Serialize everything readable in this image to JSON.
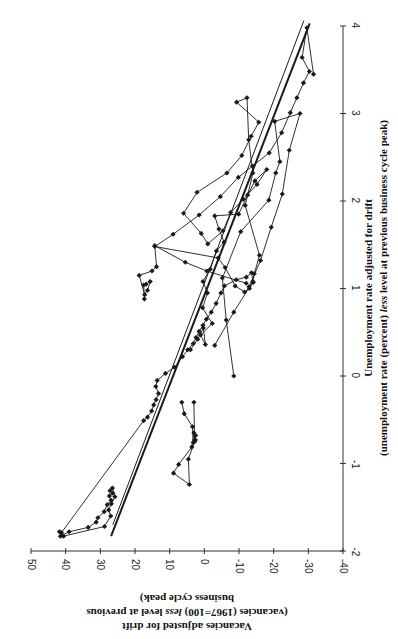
{
  "chart_data": {
    "type": "line",
    "orientation": "rotated 90deg clockwise (x-axis drawn vertically on right, y-axis drawn horizontally at bottom)",
    "title": "",
    "xlabel": "Unemployment rate adjusted for drift",
    "xlabel_sub": "(unemployment rate (percent) less level at previous business cycle peak)",
    "ylabel": "Vacancies adjusted for drift",
    "ylabel_sub_1": "(vacancies (1967=100) less level at previous",
    "ylabel_sub_2": "business cycle peak)",
    "xlim": [
      -2,
      4
    ],
    "ylim": [
      -40,
      50
    ],
    "x_ticks": [
      -2,
      -1,
      0,
      1,
      2,
      3,
      4
    ],
    "y_ticks": [
      50,
      40,
      30,
      20,
      10,
      0,
      -10,
      -20,
      -30,
      -40
    ],
    "grid": false,
    "legend": null,
    "marker": "diamond",
    "line_color": "#1a1a1a",
    "series": [
      {
        "name": "Vacancies vs unemployment (path)",
        "points": [
          [
            -1.83,
            41.5
          ],
          [
            -1.78,
            39.0
          ],
          [
            -1.73,
            33.5
          ],
          [
            -1.67,
            31.2
          ],
          [
            -1.62,
            30.7
          ],
          [
            -1.55,
            28.9
          ],
          [
            -1.47,
            28.0
          ],
          [
            -1.42,
            26.9
          ],
          [
            -1.37,
            27.4
          ],
          [
            -1.34,
            26.4
          ],
          [
            -1.31,
            27.2
          ],
          [
            -1.28,
            26.5
          ],
          [
            -1.38,
            25.8
          ],
          [
            -1.46,
            26.8
          ],
          [
            -1.53,
            27.6
          ],
          [
            -1.6,
            27.0
          ],
          [
            -1.72,
            28.8
          ],
          [
            -1.83,
            40.6
          ],
          [
            -1.78,
            41.8
          ],
          [
            -1.79,
            41.2
          ],
          [
            -0.51,
            17.5
          ],
          [
            -0.47,
            16.4
          ],
          [
            -0.4,
            15.2
          ],
          [
            -0.33,
            14.6
          ],
          [
            -0.27,
            13.9
          ],
          [
            -0.2,
            13.2
          ],
          [
            -0.12,
            14.0
          ],
          [
            -0.05,
            13.6
          ],
          [
            0.03,
            11.2
          ],
          [
            0.1,
            8.6
          ],
          [
            0.22,
            6.3
          ],
          [
            0.3,
            4.8
          ],
          [
            0.37,
            3.2
          ],
          [
            0.44,
            2.4
          ],
          [
            0.51,
            1.5
          ],
          [
            0.58,
            0.4
          ],
          [
            0.65,
            -0.6
          ],
          [
            0.73,
            -2.0
          ],
          [
            0.83,
            -3.4
          ],
          [
            0.95,
            -4.8
          ],
          [
            1.03,
            -5.8
          ],
          [
            1.1,
            -9.2
          ],
          [
            1.13,
            -12.1
          ],
          [
            1.18,
            -13.6
          ],
          [
            1.07,
            -14.1
          ],
          [
            1.0,
            -13.0
          ],
          [
            0.96,
            -11.6
          ],
          [
            1.03,
            -8.9
          ],
          [
            1.24,
            -6.0
          ],
          [
            1.35,
            -4.0
          ],
          [
            1.48,
            14.3
          ],
          [
            1.62,
            9.0
          ],
          [
            1.84,
            1.5
          ],
          [
            2.05,
            -4.6
          ],
          [
            2.27,
            -9.8
          ],
          [
            2.4,
            -13.9
          ],
          [
            2.55,
            -18.7
          ],
          [
            2.78,
            -22.3
          ],
          [
            3.01,
            -24.8
          ],
          [
            3.18,
            -26.7
          ],
          [
            3.35,
            -28.6
          ],
          [
            3.48,
            -30.3
          ],
          [
            3.64,
            -28.2
          ],
          [
            3.98,
            -29.6
          ],
          [
            3.45,
            -31.5
          ]
        ]
      },
      {
        "name": "Lower-left loop near u=-1",
        "points": [
          [
            -0.3,
            6.5
          ],
          [
            -0.43,
            5.8
          ],
          [
            -0.58,
            3.4
          ],
          [
            -0.76,
            3.2
          ],
          [
            -0.73,
            2.6
          ],
          [
            -0.68,
            2.5
          ],
          [
            -0.65,
            3.0
          ],
          [
            -0.81,
            3.6
          ],
          [
            -1.01,
            7.4
          ],
          [
            -1.11,
            8.9
          ],
          [
            -1.24,
            4.3
          ],
          [
            -0.95,
            4.6
          ],
          [
            -0.75,
            2.8
          ],
          [
            -0.3,
            3.0
          ]
        ]
      },
      {
        "name": "Upper loop near u=1",
        "points": [
          [
            0.88,
            17.3
          ],
          [
            1.04,
            17.5
          ],
          [
            1.05,
            16.8
          ],
          [
            1.08,
            15.6
          ],
          [
            0.98,
            16.4
          ],
          [
            0.93,
            17.2
          ],
          [
            1.15,
            18.8
          ],
          [
            1.2,
            15.1
          ],
          [
            1.25,
            13.8
          ],
          [
            1.49,
            14.3
          ],
          [
            1.3,
            5.5
          ],
          [
            1.2,
            -0.7
          ],
          [
            1.06,
            -12.1
          ]
        ]
      },
      {
        "name": "Mid-range cycles u=0.3..3.2",
        "points": [
          [
            0.3,
            4.0
          ],
          [
            0.42,
            1.9
          ],
          [
            0.55,
            0.3
          ],
          [
            0.36,
            -0.3
          ],
          [
            0.47,
            1.1
          ],
          [
            0.6,
            -2.3
          ],
          [
            0.78,
            0.5
          ],
          [
            0.95,
            -0.9
          ],
          [
            1.08,
            0.4
          ],
          [
            1.22,
            -1.7
          ],
          [
            1.43,
            -3.5
          ],
          [
            1.53,
            -5.7
          ],
          [
            1.68,
            -4.2
          ],
          [
            1.83,
            -3.0
          ],
          [
            1.85,
            -9.9
          ],
          [
            2.07,
            -12.5
          ],
          [
            2.23,
            -14.6
          ],
          [
            2.36,
            -18.0
          ],
          [
            2.19,
            -15.2
          ],
          [
            2.02,
            -11.2
          ],
          [
            1.87,
            -7.6
          ],
          [
            1.66,
            -5.4
          ],
          [
            1.51,
            -1.0
          ],
          [
            1.63,
            0.9
          ],
          [
            1.86,
            6.0
          ],
          [
            2.1,
            2.1
          ],
          [
            2.32,
            -6.5
          ],
          [
            2.52,
            -10.8
          ],
          [
            2.74,
            -13.5
          ],
          [
            2.9,
            -15.7
          ],
          [
            3.13,
            -9.3
          ],
          [
            3.18,
            -12.3
          ],
          [
            2.7,
            -12.8
          ],
          [
            2.32,
            -14.0
          ],
          [
            1.95,
            -11.8
          ],
          [
            1.38,
            -15.9
          ],
          [
            1.17,
            -14.4
          ],
          [
            1.08,
            -14.0
          ],
          [
            0.73,
            -8.5
          ],
          [
            0.35,
            -3.0
          ]
        ]
      },
      {
        "name": "Descending arcs to top-right",
        "points": [
          [
            0.0,
            -8.5
          ],
          [
            0.64,
            -6.3
          ],
          [
            1.12,
            -5.2
          ],
          [
            1.65,
            -10.5
          ],
          [
            2.01,
            -18.6
          ],
          [
            2.32,
            -20.6
          ],
          [
            2.45,
            -21.8
          ],
          [
            2.91,
            -20.3
          ],
          [
            3.0,
            -27.6
          ],
          [
            2.58,
            -24.5
          ],
          [
            2.08,
            -22.5
          ],
          [
            1.7,
            -19.3
          ],
          [
            1.32,
            -16.2
          ],
          [
            1.02,
            -12.9
          ]
        ]
      }
    ],
    "regression_lines": [
      {
        "name": "Fitted line (bold)",
        "from": [
          -1.83,
          26.9
        ],
        "to": [
          4.03,
          -30.4
        ],
        "width": 2
      },
      {
        "name": "Fitted line (thin)",
        "from": [
          -1.7,
          26.4
        ],
        "to": [
          4.06,
          -28.7
        ],
        "width": 1
      }
    ]
  }
}
